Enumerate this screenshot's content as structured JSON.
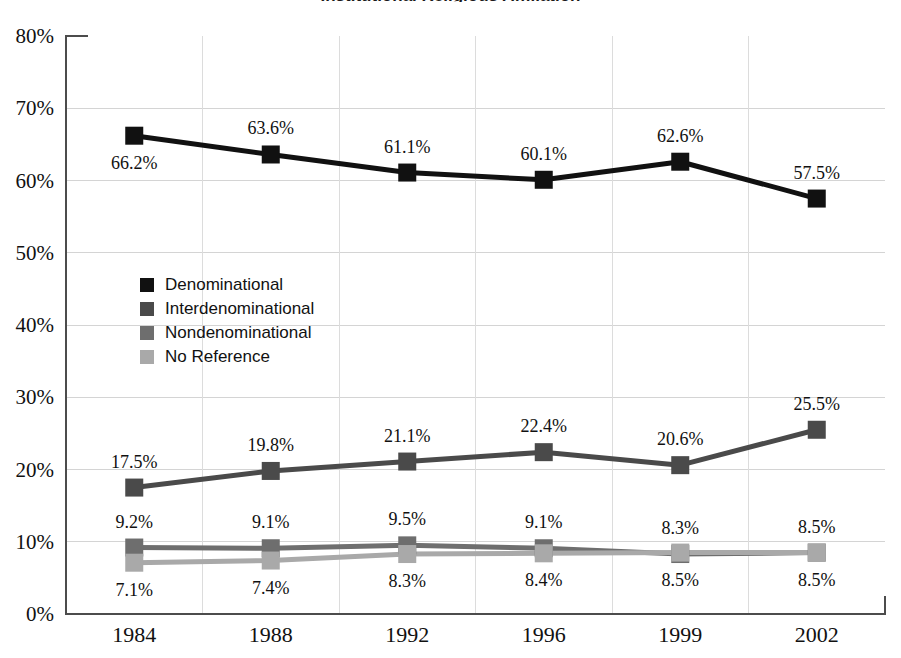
{
  "chart_data": {
    "type": "line",
    "title": "Institutional Religious Affiliation",
    "xlabel": "",
    "ylabel": "",
    "categories": [
      "1984",
      "1988",
      "1992",
      "1996",
      "1999",
      "2002"
    ],
    "ylim": [
      0,
      80
    ],
    "ytick_labels": [
      "0%",
      "10%",
      "20%",
      "30%",
      "40%",
      "50%",
      "60%",
      "70%",
      "80%"
    ],
    "ytick_values": [
      0,
      10,
      20,
      30,
      40,
      50,
      60,
      70,
      80
    ],
    "grid": "horizontal-and-vertical",
    "legend_position": "inside-left-upper-middle",
    "series": [
      {
        "name": "Denominational",
        "color": "#111111",
        "values": [
          66.2,
          63.6,
          61.1,
          60.1,
          62.6,
          57.5
        ],
        "labels": [
          "66.2%",
          "63.6%",
          "61.1%",
          "60.1%",
          "62.6%",
          "57.5%"
        ],
        "label_positions": [
          "below",
          "above",
          "above",
          "above",
          "above",
          "above"
        ]
      },
      {
        "name": "Interdenominational",
        "color": "#4a4a4a",
        "values": [
          17.5,
          19.8,
          21.1,
          22.4,
          20.6,
          25.5
        ],
        "labels": [
          "17.5%",
          "19.8%",
          "21.1%",
          "22.4%",
          "20.6%",
          "25.5%"
        ],
        "label_positions": [
          "above",
          "above",
          "above",
          "above",
          "above",
          "above"
        ]
      },
      {
        "name": "Nondenominational",
        "color": "#6e6e6e",
        "values": [
          9.2,
          9.1,
          9.5,
          9.1,
          8.3,
          8.5
        ],
        "labels": [
          "9.2%",
          "9.1%",
          "9.5%",
          "9.1%",
          "8.3%",
          "8.5%"
        ],
        "label_positions": [
          "above",
          "above",
          "above",
          "above",
          "above",
          "above"
        ]
      },
      {
        "name": "No Reference",
        "color": "#a9a9a9",
        "values": [
          7.1,
          7.4,
          8.3,
          8.4,
          8.5,
          8.5
        ],
        "labels": [
          "7.1%",
          "7.4%",
          "8.3%",
          "8.4%",
          "8.5%",
          "8.5%"
        ],
        "label_positions": [
          "below",
          "below",
          "below",
          "below",
          "below",
          "below"
        ]
      }
    ]
  },
  "legend": {
    "items": [
      {
        "label": "Denominational",
        "color": "#111111"
      },
      {
        "label": "Interdenominational",
        "color": "#4a4a4a"
      },
      {
        "label": "Nondenominational",
        "color": "#6e6e6e"
      },
      {
        "label": "No Reference",
        "color": "#a9a9a9"
      }
    ]
  }
}
